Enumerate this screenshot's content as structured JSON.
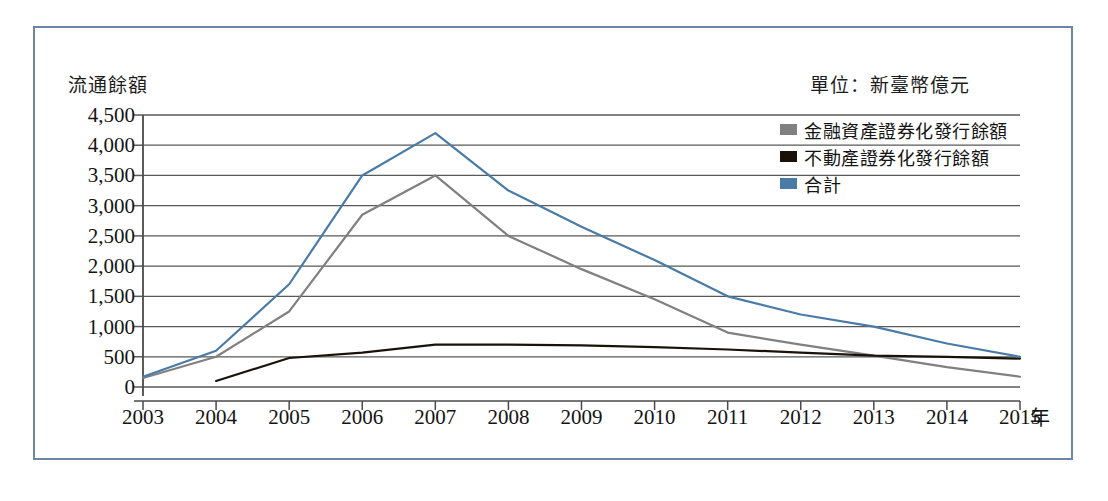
{
  "figure": {
    "axis_title": "流通餘額",
    "unit_note": "單位：新臺幣億元",
    "xaxis_unit": "年",
    "border_color": "#6b87a8"
  },
  "legend": {
    "items": [
      {
        "label": "金融資產證券化發行餘額",
        "color": "#808080"
      },
      {
        "label": "不動產證券化發行餘額",
        "color": "#1a1208"
      },
      {
        "label": "合計",
        "color": "#4a7ba7"
      }
    ]
  },
  "chart_data": {
    "type": "line",
    "title": "",
    "xlabel": "年",
    "ylabel": "流通餘額",
    "unit": "新臺幣億元",
    "grid": true,
    "legend_position": "top-right",
    "categories": [
      "2003",
      "2004",
      "2005",
      "2006",
      "2007",
      "2008",
      "2009",
      "2010",
      "2011",
      "2012",
      "2013",
      "2014",
      "2015"
    ],
    "x_tick_labels": [
      "2003",
      "2004",
      "2005",
      "2006",
      "2007",
      "2008",
      "2009",
      "2010",
      "2011",
      "2012",
      "2013",
      "2014",
      "2015"
    ],
    "y_tick_labels": [
      "4,500",
      "4,000",
      "3,500",
      "3,000",
      "2,500",
      "2,000",
      "1,500",
      "1,000",
      "500",
      "0"
    ],
    "y_ticks": [
      4500,
      4000,
      3500,
      3000,
      2500,
      2000,
      1500,
      1000,
      500,
      0
    ],
    "ylim": [
      0,
      4500
    ],
    "series": [
      {
        "name": "金融資產證券化發行餘額",
        "color": "#808080",
        "values": [
          150,
          500,
          1250,
          2850,
          3500,
          2500,
          1950,
          1450,
          900,
          700,
          520,
          330,
          170
        ]
      },
      {
        "name": "不動產證券化發行餘額",
        "color": "#1a1208",
        "values": [
          null,
          100,
          480,
          570,
          700,
          700,
          690,
          660,
          620,
          570,
          520,
          500,
          470
        ]
      },
      {
        "name": "合計",
        "color": "#4a7ba7",
        "values": [
          170,
          600,
          1700,
          3500,
          4200,
          3250,
          2650,
          2100,
          1500,
          1200,
          1000,
          720,
          500
        ]
      }
    ]
  }
}
